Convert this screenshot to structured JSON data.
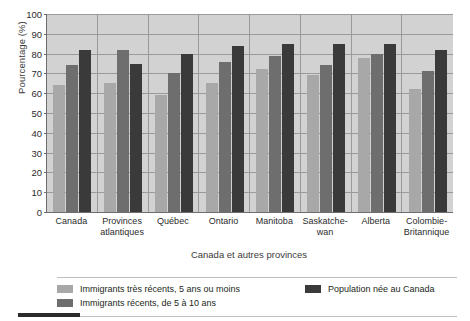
{
  "axis": {
    "ylabel": "Pourcentage (%)",
    "xlabel": "Canada et autres provinces",
    "yticks": [
      100,
      90,
      80,
      70,
      60,
      50,
      40,
      30,
      20,
      10,
      0
    ]
  },
  "legend": {
    "items": [
      {
        "label": "Immigrants très récents, 5 ans ou moins",
        "color": "#a8a8a8"
      },
      {
        "label": "Population née au Canada",
        "color": "#3a3a3a"
      },
      {
        "label": "Immigrants récents, de 5 à 10 ans",
        "color": "#6e6e6e"
      }
    ]
  },
  "colors": {
    "series_very_recent": "#a8a8a8",
    "series_recent": "#6e6e6e",
    "series_canadian_born": "#3a3a3a",
    "plot_background": "#d2d2d2",
    "gridline": "#9a9a9a",
    "axis": "#6d6d6d"
  },
  "chart_data": {
    "type": "bar",
    "title": "",
    "xlabel": "Canada et autres provinces",
    "ylabel": "Pourcentage (%)",
    "ylim": [
      0,
      100
    ],
    "ytick_step": 10,
    "grid": true,
    "legend_position": "bottom",
    "categories": [
      "Canada",
      "Provinces atlantiques",
      "Québec",
      "Ontario",
      "Manitoba",
      "Saskatche-wan",
      "Alberta",
      "Colombie-Britannique"
    ],
    "series": [
      {
        "name": "Immigrants très récents, 5 ans ou moins",
        "color": "#a8a8a8",
        "values": [
          64,
          65,
          59,
          65,
          72,
          69,
          78,
          62
        ]
      },
      {
        "name": "Immigrants récents, de 5 à 10 ans",
        "color": "#6e6e6e",
        "values": [
          74,
          82,
          70,
          76,
          79,
          74,
          80,
          71
        ]
      },
      {
        "name": "Population née au Canada",
        "color": "#3a3a3a",
        "values": [
          82,
          75,
          80,
          84,
          85,
          85,
          85,
          82
        ]
      }
    ]
  }
}
